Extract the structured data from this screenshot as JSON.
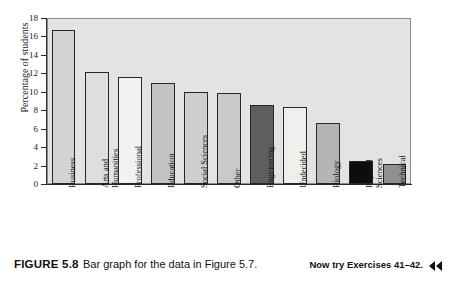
{
  "figure": {
    "label": "FIGURE 5.8",
    "caption": "Bar graph for the data in Figure 5.7.",
    "now_try": "Now try Exercises 41–42.",
    "now_try_icon": "double-left-triangle-icon"
  },
  "chart_data": {
    "type": "bar",
    "title": "",
    "xlabel": "",
    "ylabel": "Percentage of students",
    "ylim": [
      0,
      18
    ],
    "ytick_step": 2,
    "yticks": [
      0,
      2,
      4,
      6,
      8,
      10,
      12,
      14,
      16,
      18
    ],
    "ytick_labels": [
      "0",
      "2",
      "4",
      "6",
      "8",
      "10",
      "12",
      "14",
      "16",
      "18"
    ],
    "grid": false,
    "legend": "none",
    "plot_background": "#e3e3e1",
    "bar_edge_color": "#262626",
    "categories": [
      "Business",
      "Arts and\nHumanities",
      "Professional",
      "Education",
      "Social Sciences",
      "Other",
      "Engineering",
      "Undecided",
      "Biology",
      "Physical\nSciences",
      "Technical"
    ],
    "values": [
      16.7,
      12.1,
      11.6,
      11.0,
      10.0,
      9.9,
      8.6,
      8.3,
      6.6,
      2.5,
      2.2
    ],
    "bar_colors": [
      "#d3d3d1",
      "#dedede",
      "#f2f2f0",
      "#c3c3c1",
      "#cfcfcd",
      "#c9c9c7",
      "#5e5e5e",
      "#efefed",
      "#b5b5b3",
      "#0d0d0d",
      "#909090"
    ]
  }
}
